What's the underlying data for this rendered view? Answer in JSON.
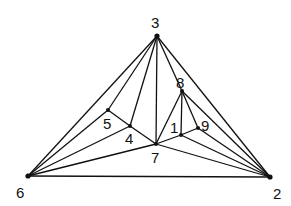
{
  "diagram": {
    "type": "planar-triangulation-graph",
    "nodes": [
      {
        "id": "1",
        "label": "1",
        "x": 181,
        "y": 135,
        "lx": 170,
        "ly": 133
      },
      {
        "id": "2",
        "label": "2",
        "x": 270,
        "y": 177,
        "lx": 273,
        "ly": 199
      },
      {
        "id": "3",
        "label": "3",
        "x": 157,
        "y": 36,
        "lx": 151,
        "ly": 28
      },
      {
        "id": "4",
        "label": "4",
        "x": 130,
        "y": 126,
        "lx": 125,
        "ly": 144
      },
      {
        "id": "5",
        "label": "5",
        "x": 108,
        "y": 110,
        "lx": 103,
        "ly": 129
      },
      {
        "id": "6",
        "label": "6",
        "x": 28,
        "y": 176,
        "lx": 16,
        "ly": 198
      },
      {
        "id": "7",
        "label": "7",
        "x": 156,
        "y": 144,
        "lx": 151,
        "ly": 163
      },
      {
        "id": "8",
        "label": "8",
        "x": 182,
        "y": 91,
        "lx": 176,
        "ly": 88
      },
      {
        "id": "9",
        "label": "9",
        "x": 198,
        "y": 128,
        "lx": 201,
        "ly": 131
      }
    ],
    "edges": [
      [
        "3",
        "6"
      ],
      [
        "3",
        "5"
      ],
      [
        "3",
        "4"
      ],
      [
        "3",
        "7"
      ],
      [
        "3",
        "8"
      ],
      [
        "3",
        "2"
      ],
      [
        "5",
        "6"
      ],
      [
        "5",
        "4"
      ],
      [
        "4",
        "6"
      ],
      [
        "4",
        "7"
      ],
      [
        "7",
        "6"
      ],
      [
        "6",
        "2"
      ],
      [
        "7",
        "8"
      ],
      [
        "7",
        "1"
      ],
      [
        "7",
        "2"
      ],
      [
        "8",
        "1"
      ],
      [
        "8",
        "9"
      ],
      [
        "8",
        "2"
      ],
      [
        "1",
        "9"
      ],
      [
        "1",
        "2"
      ],
      [
        "9",
        "2"
      ]
    ]
  }
}
